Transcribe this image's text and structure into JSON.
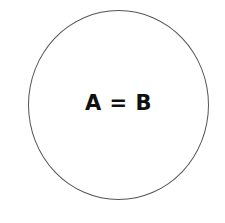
{
  "diagram": {
    "shape": "circle",
    "label": "A = B",
    "stroke_color": "#555555",
    "text_color": "#111111",
    "background_color": "#ffffff"
  }
}
